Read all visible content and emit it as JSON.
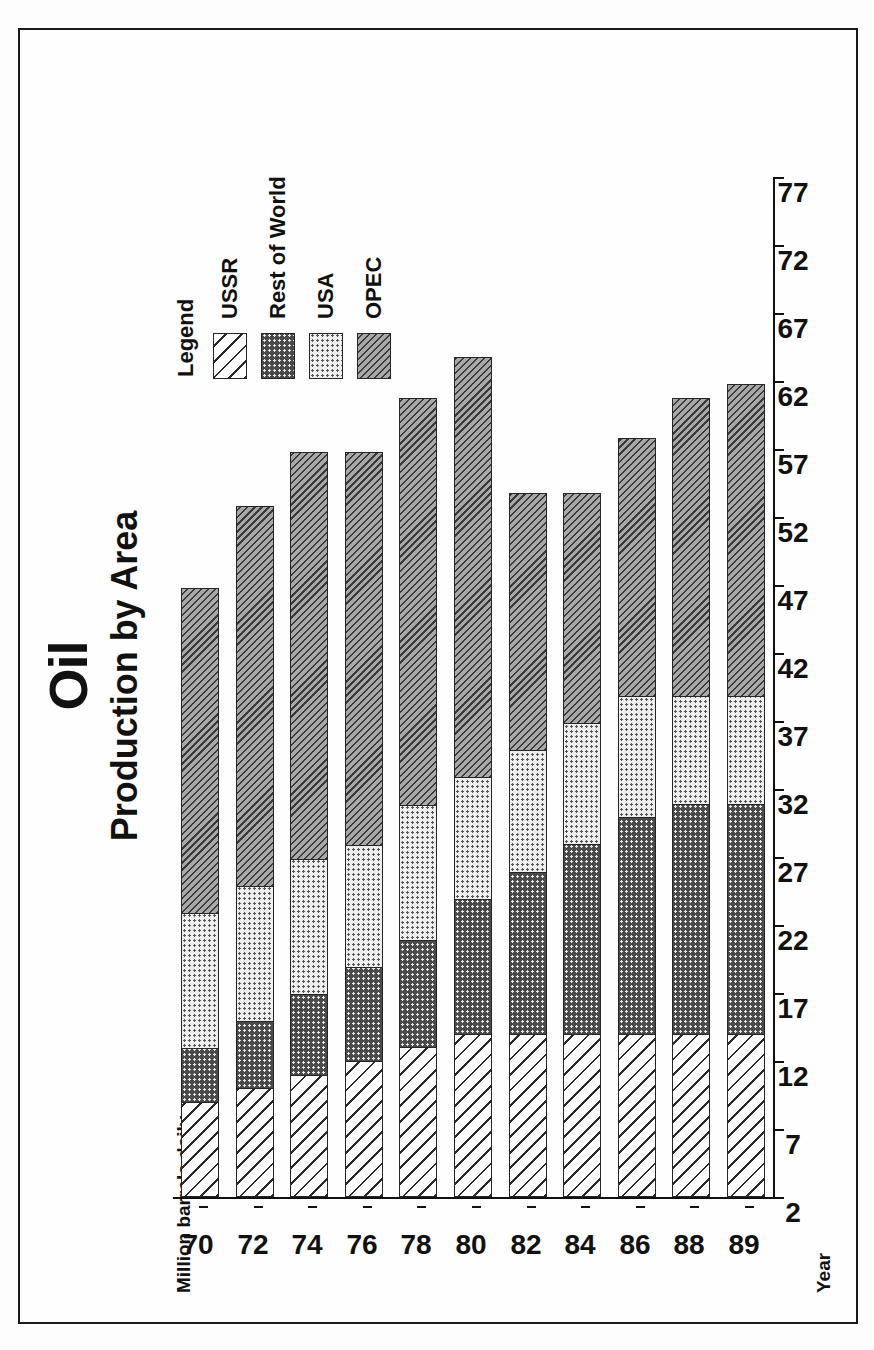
{
  "figure": {
    "title": "Oil",
    "subtitle": "Production by Area",
    "value_axis_label": "Million barrels daily",
    "category_axis_label": "Year"
  },
  "legend": {
    "title": "Legend",
    "items": [
      {
        "label": "USSR",
        "pattern": "diagonal-hatch-wide",
        "color": "#ffffff"
      },
      {
        "label": "Rest of World",
        "pattern": "dark-dots",
        "color": "#4a4a4a"
      },
      {
        "label": "USA",
        "pattern": "light-dots",
        "color": "#eeeeee"
      },
      {
        "label": "OPEC",
        "pattern": "diagonal-hatch-dense",
        "color": "#a8a8a8"
      }
    ]
  },
  "chart_data": {
    "type": "bar",
    "orientation": "horizontal-stacked",
    "title": "Oil",
    "subtitle": "Production by Area",
    "xlabel": "Million barrels daily",
    "ylabel": "Year",
    "xlim": [
      2,
      77
    ],
    "xticks": [
      2,
      7,
      12,
      17,
      22,
      27,
      32,
      37,
      42,
      47,
      52,
      57,
      62,
      67,
      72,
      77
    ],
    "grid": false,
    "legend_position": "right",
    "categories": [
      "70",
      "72",
      "74",
      "76",
      "78",
      "80",
      "82",
      "84",
      "86",
      "88",
      "89"
    ],
    "stack_order_from_axis": [
      "USSR",
      "Rest of World",
      "USA",
      "OPEC"
    ],
    "series": [
      {
        "name": "USSR",
        "values": [
          7,
          8,
          9,
          10,
          11,
          12,
          12,
          12,
          12,
          12,
          12
        ]
      },
      {
        "name": "Rest of World",
        "values": [
          4,
          5,
          6,
          7,
          8,
          10,
          12,
          14,
          16,
          17,
          17
        ]
      },
      {
        "name": "USA",
        "values": [
          10,
          10,
          10,
          9,
          10,
          9,
          9,
          9,
          9,
          8,
          8
        ]
      },
      {
        "name": "OPEC",
        "values": [
          24,
          28,
          30,
          29,
          30,
          31,
          19,
          17,
          19,
          22,
          23
        ]
      }
    ],
    "totals": [
      45,
      51,
      55,
      55,
      59,
      62,
      52,
      52,
      56,
      59,
      60
    ]
  }
}
